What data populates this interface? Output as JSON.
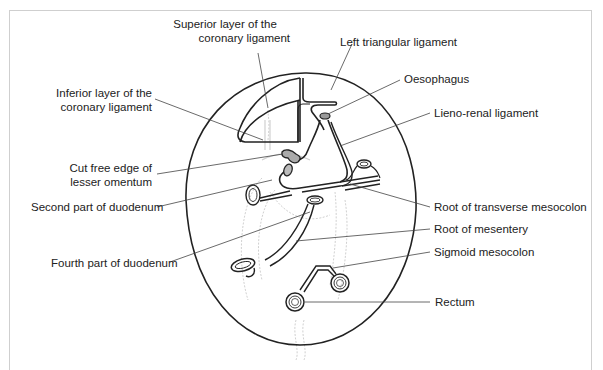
{
  "figure": {
    "labels": {
      "superior_coronary_1": "Superior layer of the",
      "superior_coronary_2": "coronary ligament",
      "left_triangular": "Left triangular ligament",
      "inferior_coronary_1": "Inferior layer of the",
      "inferior_coronary_2": "coronary ligament",
      "oesophagus": "Oesophagus",
      "lieno_renal": "Lieno-renal ligament",
      "cut_free_edge_1": "Cut free edge of",
      "cut_free_edge_2": "lesser omentum",
      "second_duodenum": "Second part of duodenum",
      "transverse_mesocolon": "Root of transverse mesocolon",
      "root_mesentery": "Root of mesentery",
      "fourth_duodenum": "Fourth part of duodenum",
      "sigmoid_mesocolon": "Sigmoid mesocolon",
      "rectum": "Rectum"
    },
    "colors": {
      "outline": "#222222",
      "leader": "#444444",
      "faint": "#bdbdbd",
      "frame": "#cfcfcf"
    }
  }
}
